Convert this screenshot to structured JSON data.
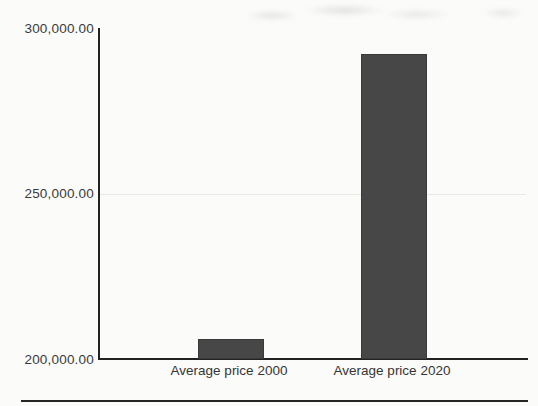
{
  "chart_data": {
    "type": "bar",
    "categories": [
      "Average price 2000",
      "Average price 2020"
    ],
    "values": [
      206000,
      292000
    ],
    "title": "",
    "xlabel": "",
    "ylabel": "",
    "ylim": [
      200000,
      300000
    ],
    "yticks": [
      {
        "value": 300000,
        "label": "300,000.00"
      },
      {
        "value": 250000,
        "label": "250,000.00"
      },
      {
        "value": 200000,
        "label": "200,000.00"
      }
    ],
    "gridline_values": [
      250000
    ],
    "legend": "none",
    "bar_color": "#474747",
    "axis_color": "#222222",
    "gridline_color": "#e9e9e4",
    "label_color": "#3a3a3a"
  }
}
